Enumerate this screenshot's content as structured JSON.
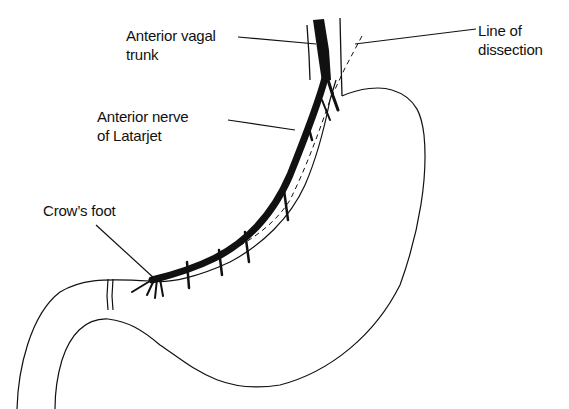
{
  "diagram": {
    "colors": {
      "ink": "#111111",
      "background": "#ffffff"
    },
    "labels": [
      {
        "id": "anterior-vagal-trunk",
        "lines": [
          "Anterior vagal",
          "trunk"
        ]
      },
      {
        "id": "line-of-dissection",
        "lines": [
          "Line of",
          "dissection"
        ]
      },
      {
        "id": "anterior-nerve-of-latarjet",
        "lines": [
          "Anterior nerve",
          "of Latarjet"
        ]
      },
      {
        "id": "crows-foot",
        "lines": [
          "Crow’s foot"
        ]
      }
    ],
    "structures": [
      "esophagus",
      "stomach-outline",
      "lesser-curvature",
      "greater-curvature",
      "pylorus",
      "duodenum",
      "anterior-vagal-trunk",
      "nerve-of-latarjet",
      "crows-foot-branches",
      "dissection-line-dashed"
    ]
  }
}
